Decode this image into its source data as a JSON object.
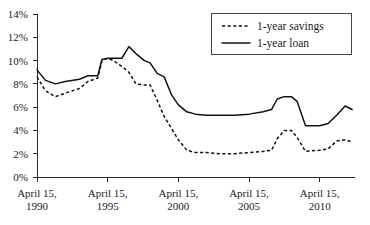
{
  "chart_data": {
    "type": "line",
    "title": "",
    "subtitle": "",
    "xlabel": "",
    "ylabel": "",
    "grid": false,
    "legend_position": "top-right",
    "ylim": [
      0,
      14
    ],
    "xlim": [
      1990,
      2012.5
    ],
    "y_ticks": [
      "0%",
      "2%",
      "4%",
      "6%",
      "8%",
      "10%",
      "12%",
      "14%"
    ],
    "y_tick_values": [
      0,
      2,
      4,
      6,
      8,
      10,
      12,
      14
    ],
    "x_ticks": [
      "April 15,\n1990",
      "April 15,\n1995",
      "April 15,\n2000",
      "April 15,\n2005",
      "April 15,\n2010"
    ],
    "x_tick_values": [
      1990,
      1995,
      2000,
      2005,
      2010
    ],
    "x_tick_lines": [
      {
        "line1": "April 15,",
        "line2": "1990"
      },
      {
        "line1": "April 15,",
        "line2": "1995"
      },
      {
        "line1": "April 15,",
        "line2": "2000"
      },
      {
        "line1": "April 15,",
        "line2": "2005"
      },
      {
        "line1": "April 15,",
        "line2": "2010"
      }
    ],
    "series": [
      {
        "name": "1-year savings",
        "style": "dashed",
        "color": "#111111",
        "x": [
          1990,
          1990.6,
          1991.3,
          1992,
          1993,
          1993.6,
          1994.3,
          1994.6,
          1995,
          1995.4,
          1996,
          1996.5,
          1997,
          1997.6,
          1998,
          1998.5,
          1999,
          1999.5,
          2000,
          2000.6,
          2001.2,
          2002,
          2003,
          2004,
          2005,
          2006,
          2006.6,
          2007,
          2007.5,
          2008,
          2008.4,
          2009,
          2010,
          2010.6,
          2011.2,
          2011.8,
          2012.3
        ],
        "y": [
          8.6,
          7.4,
          6.9,
          7.2,
          7.6,
          8.2,
          8.5,
          10.0,
          10.2,
          10.0,
          9.5,
          9.0,
          8.0,
          7.9,
          7.9,
          6.6,
          5.2,
          4.2,
          3.2,
          2.3,
          2.1,
          2.1,
          2.0,
          2.0,
          2.1,
          2.2,
          2.3,
          3.3,
          4.0,
          4.0,
          3.4,
          2.2,
          2.3,
          2.4,
          3.1,
          3.2,
          3.0
        ]
      },
      {
        "name": "1-year loan",
        "style": "solid",
        "color": "#111111",
        "x": [
          1990,
          1990.6,
          1991.3,
          1992,
          1993,
          1993.6,
          1994.3,
          1994.6,
          1995,
          1995.4,
          1996,
          1996.5,
          1997,
          1997.6,
          1998,
          1998.5,
          1999,
          1999.5,
          2000,
          2000.6,
          2001.2,
          2002,
          2003,
          2004,
          2005,
          2006,
          2006.6,
          2007,
          2007.5,
          2008,
          2008.4,
          2009,
          2010,
          2010.6,
          2011.2,
          2011.8,
          2012.3
        ],
        "y": [
          9.2,
          8.3,
          8.0,
          8.2,
          8.4,
          8.7,
          8.7,
          10.1,
          10.2,
          10.2,
          10.2,
          11.2,
          10.6,
          10.0,
          9.8,
          8.9,
          8.6,
          7.1,
          6.2,
          5.6,
          5.4,
          5.3,
          5.3,
          5.3,
          5.4,
          5.6,
          5.8,
          6.7,
          6.9,
          6.9,
          6.5,
          4.4,
          4.4,
          4.6,
          5.3,
          6.1,
          5.8
        ]
      }
    ],
    "legend": [
      {
        "label": "1-year savings",
        "style": "dashed"
      },
      {
        "label": "1-year loan",
        "style": "solid"
      }
    ]
  }
}
